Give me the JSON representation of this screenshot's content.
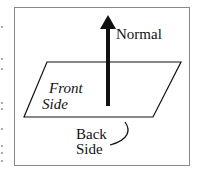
{
  "diagram": {
    "labels": {
      "normal": "Normal",
      "front_line1": "Front",
      "front_line2": "Side",
      "back_line1": "Back",
      "back_line2": "Side"
    },
    "colors": {
      "stroke": "#111111",
      "frame": "#888888"
    }
  }
}
